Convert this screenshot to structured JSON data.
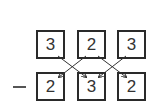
{
  "diagram": {
    "operator": "minus",
    "top_row": [
      {
        "value": "3"
      },
      {
        "value": "2"
      },
      {
        "value": "3"
      }
    ],
    "bottom_row": [
      {
        "value": "2"
      },
      {
        "value": "3"
      },
      {
        "value": "2"
      }
    ],
    "colors": {
      "stroke": "#2a2a2a",
      "text": "#333333"
    }
  }
}
